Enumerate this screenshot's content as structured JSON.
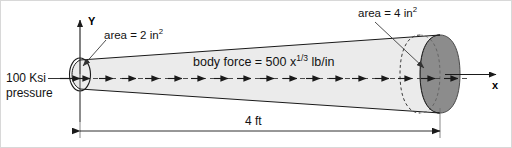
{
  "figure": {
    "colors": {
      "body_fill": "#ebebeb",
      "endcap_fill": "#8c8c8c",
      "line": "#1a1a1a",
      "text": "#121212",
      "background": "#ffffff"
    }
  },
  "labels": {
    "y_axis": "Y",
    "x_axis": "x",
    "area_left_text": "area = 2 in",
    "area_left_sup": "2",
    "area_right_text": "area = 4 in",
    "area_right_sup": "2",
    "body_force_prefix": "body force = 500 x",
    "body_force_exp": "1/3",
    "body_force_suffix": " lb/in",
    "pressure_line1": "100 Ksi",
    "pressure_line2": "pressure",
    "length_dim": "4 ft"
  },
  "diagram_values": {
    "left_area": "2 in^2",
    "right_area": "4 in^2",
    "length": "4 ft",
    "pressure": "100 Ksi",
    "body_force": "500 x^(1/3) lb/in",
    "arrow_count": 17
  }
}
